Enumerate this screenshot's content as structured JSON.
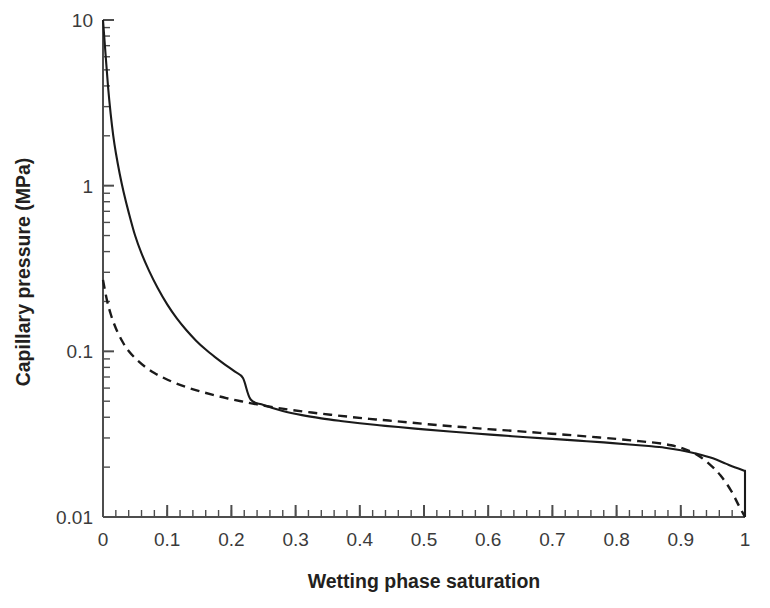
{
  "chart_data": {
    "type": "line",
    "title": "",
    "xlabel": "Wetting phase saturation",
    "ylabel": "Capillary pressure (MPa)",
    "xlim": [
      0,
      1
    ],
    "ylim": [
      0.01,
      10
    ],
    "yscale": "log",
    "xscale": "linear",
    "grid": false,
    "legend": "none",
    "xticks": [
      "0",
      "0.1",
      "0.2",
      "0.3",
      "0.4",
      "0.5",
      "0.6",
      "0.7",
      "0.8",
      "0.9",
      "1"
    ],
    "xtick_values": [
      0,
      0.1,
      0.2,
      0.3,
      0.4,
      0.5,
      0.6,
      0.7,
      0.8,
      0.9,
      1
    ],
    "xminor_step": 0.02,
    "yticks": [
      "10",
      "1",
      "0.1",
      "0.01"
    ],
    "ytick_values": [
      10,
      1,
      0.1,
      0.01
    ],
    "series": [
      {
        "name": "solid-curve",
        "style": "solid",
        "color": "#1a1a1a",
        "x": [
          0.0,
          0.004,
          0.008,
          0.012,
          0.016,
          0.02,
          0.026,
          0.032,
          0.04,
          0.05,
          0.06,
          0.072,
          0.085,
          0.1,
          0.115,
          0.13,
          0.145,
          0.16,
          0.175,
          0.19,
          0.205,
          0.218,
          0.23,
          0.25,
          0.28,
          0.31,
          0.34,
          0.37,
          0.4,
          0.43,
          0.46,
          0.5,
          0.54,
          0.58,
          0.62,
          0.66,
          0.7,
          0.74,
          0.78,
          0.82,
          0.85,
          0.875,
          0.9,
          0.925,
          0.95,
          0.97,
          0.985,
          1.0
        ],
        "y": [
          10.0,
          6.2,
          3.9,
          2.7,
          2.0,
          1.58,
          1.18,
          0.92,
          0.69,
          0.5,
          0.39,
          0.305,
          0.242,
          0.192,
          0.158,
          0.134,
          0.116,
          0.1025,
          0.092,
          0.0832,
          0.0756,
          0.069,
          0.0512,
          0.0475,
          0.0437,
          0.0412,
          0.0394,
          0.038,
          0.0368,
          0.0358,
          0.0349,
          0.0338,
          0.0328,
          0.0319,
          0.0311,
          0.0303,
          0.0296,
          0.0289,
          0.0282,
          0.0274,
          0.0268,
          0.0262,
          0.0253,
          0.0241,
          0.0226,
          0.021,
          0.0199,
          0.019
        ],
        "end_drop_to": 0.01,
        "note": "Drainage-style curve; entry at 10 MPa, kink near S=0.23, vertical drop at S=1"
      },
      {
        "name": "dashed-curve",
        "style": "dashed",
        "color": "#1a1a1a",
        "x": [
          0.0,
          0.006,
          0.012,
          0.02,
          0.03,
          0.04,
          0.052,
          0.065,
          0.08,
          0.095,
          0.112,
          0.13,
          0.15,
          0.17,
          0.192,
          0.215,
          0.24,
          0.268,
          0.295,
          0.325,
          0.355,
          0.385,
          0.415,
          0.445,
          0.48,
          0.52,
          0.56,
          0.6,
          0.64,
          0.68,
          0.72,
          0.76,
          0.8,
          0.835,
          0.862,
          0.885,
          0.905,
          0.925,
          0.945,
          0.962,
          0.978,
          0.99,
          1.0
        ],
        "y": [
          0.27,
          0.205,
          0.168,
          0.138,
          0.115,
          0.1005,
          0.0895,
          0.081,
          0.074,
          0.069,
          0.0645,
          0.0608,
          0.0575,
          0.0548,
          0.0522,
          0.05,
          0.0478,
          0.0458,
          0.0442,
          0.0427,
          0.0414,
          0.0402,
          0.0391,
          0.0382,
          0.0371,
          0.0359,
          0.0349,
          0.0339,
          0.0331,
          0.0322,
          0.0314,
          0.0305,
          0.0296,
          0.0287,
          0.028,
          0.0271,
          0.0258,
          0.0238,
          0.0208,
          0.0178,
          0.0145,
          0.0118,
          0.01
        ],
        "note": "Imbibition-style curve; lower entry pressure, merges with solid 0.42-0.87, falls to 0.01 at S=1"
      }
    ]
  },
  "axes": {
    "x_title": "Wetting phase saturation",
    "y_title": "Capillary pressure (MPa)"
  }
}
